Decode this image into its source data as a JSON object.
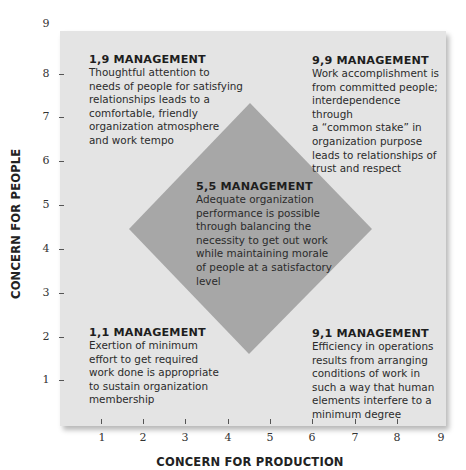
{
  "diagram": {
    "type": "managerial-grid",
    "colors": {
      "grid_background": "#e4e4e4",
      "diamond_fill": "#a7a7a7",
      "text": "#2b2b2b"
    },
    "x_axis": {
      "title": "CONCERN FOR PRODUCTION",
      "ticks": [
        "1",
        "2",
        "3",
        "4",
        "5",
        "6",
        "7",
        "8",
        "9"
      ]
    },
    "y_axis": {
      "title": "CONCERN FOR PEOPLE",
      "ticks": [
        "1",
        "2",
        "3",
        "4",
        "5",
        "6",
        "7",
        "8",
        "9"
      ]
    },
    "styles": [
      {
        "id": "1,9",
        "heading": "1,9 MANAGEMENT",
        "lines": [
          "Thoughtful attention to",
          "needs of people for satisfying",
          "relationships leads to a",
          "comfortable, friendly",
          "organization atmosphere",
          "and work tempo"
        ]
      },
      {
        "id": "9,9",
        "heading": "9,9 MANAGEMENT",
        "lines": [
          "Work accomplishment is",
          "from committed people;",
          "interdependence through",
          "a “common stake” in",
          "organization purpose",
          "leads to relationships of",
          "trust and respect"
        ]
      },
      {
        "id": "5,5",
        "heading": "5,5 MANAGEMENT",
        "lines": [
          "Adequate organization",
          "performance is possible",
          "through balancing the",
          "necessity to get out work",
          "while maintaining morale",
          "of people at a satisfactory",
          "level"
        ]
      },
      {
        "id": "1,1",
        "heading": "1,1 MANAGEMENT",
        "lines": [
          "Exertion of minimum",
          "effort to get required",
          "work done is appropriate",
          "to sustain organization",
          "membership"
        ]
      },
      {
        "id": "9,1",
        "heading": "9,1 MANAGEMENT",
        "lines": [
          "Efficiency in operations",
          "results from arranging",
          "conditions of work in",
          "such a way that human",
          "elements interfere to a",
          "minimum degree"
        ]
      }
    ]
  }
}
